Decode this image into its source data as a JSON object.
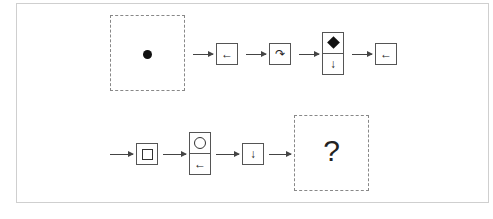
{
  "puzzle": {
    "start_panel": {
      "content": "filled-dot"
    },
    "row1": [
      {
        "type": "single",
        "symbol": "←"
      },
      {
        "type": "single",
        "symbol": "↷"
      },
      {
        "type": "stacked",
        "top": "filled-diamond",
        "bottom": "↓"
      },
      {
        "type": "single",
        "symbol": "←"
      }
    ],
    "row2": [
      {
        "type": "single",
        "symbol": "square"
      },
      {
        "type": "stacked",
        "top": "circle",
        "bottom": "←"
      },
      {
        "type": "single",
        "symbol": "↓"
      }
    ],
    "answer_panel": {
      "label": "?"
    }
  },
  "labels": {
    "r1_b1": "←",
    "r1_b2": "↷",
    "r1_b3_bottom": "↓",
    "r1_b4": "←",
    "r2_b2_bottom": "←",
    "r2_b3": "↓",
    "question": "?"
  }
}
